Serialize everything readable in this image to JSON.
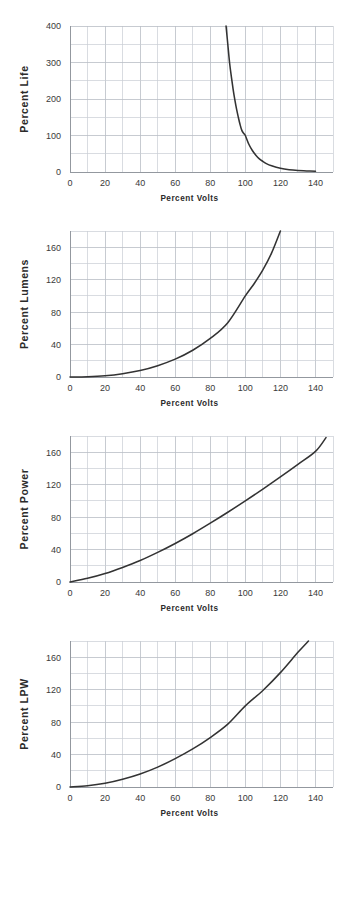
{
  "figure": {
    "background": "#ffffff",
    "curve_color": "#333333",
    "grid_color": "#c9cdd4",
    "axis_color": "#8d9299",
    "label_color": "#3a3a3a",
    "title_color": "#2b2b2b"
  },
  "chart_data": [
    {
      "type": "line",
      "title": "",
      "xlabel": "Percent Volts",
      "ylabel": "Percent Life",
      "xlim": [
        0,
        150
      ],
      "ylim": [
        0,
        400
      ],
      "xticks": [
        0,
        20,
        40,
        60,
        80,
        100,
        120,
        140
      ],
      "yticks": [
        0,
        100,
        200,
        300,
        400
      ],
      "xtick_labels": [
        "0",
        "20",
        "40",
        "60",
        "80",
        "100",
        "120",
        "140"
      ],
      "ytick_labels": [
        "0",
        "100",
        "200",
        "300",
        "400"
      ],
      "x_minor_step": 10,
      "y_minor_step": 50,
      "grid": true,
      "legend": "none",
      "series": [
        {
          "name": "Percent Life",
          "x": [
            89,
            90,
            91,
            92,
            93,
            94,
            95,
            96,
            97,
            98,
            99,
            100,
            102,
            104,
            106,
            108,
            110,
            112,
            115,
            120,
            125,
            130,
            135,
            140
          ],
          "y": [
            400,
            350,
            300,
            262,
            228,
            198,
            172,
            150,
            130,
            114,
            106,
            100,
            76,
            59,
            46,
            36,
            29,
            23,
            17,
            10,
            6,
            4,
            3,
            2
          ]
        }
      ]
    },
    {
      "type": "line",
      "title": "",
      "xlabel": "Percent Volts",
      "ylabel": "Percent Lumens",
      "xlim": [
        0,
        150
      ],
      "ylim": [
        0,
        180
      ],
      "xticks": [
        0,
        20,
        40,
        60,
        80,
        100,
        120,
        140
      ],
      "yticks": [
        0,
        40,
        80,
        120,
        160
      ],
      "xtick_labels": [
        "0",
        "20",
        "40",
        "60",
        "80",
        "100",
        "120",
        "140"
      ],
      "ytick_labels": [
        "0",
        "40",
        "80",
        "120",
        "160"
      ],
      "x_minor_step": 10,
      "y_minor_step": 20,
      "grid": true,
      "legend": "none",
      "series": [
        {
          "name": "Percent Lumens",
          "x": [
            0,
            10,
            20,
            30,
            40,
            50,
            60,
            70,
            80,
            90,
            100,
            105,
            110,
            115,
            120
          ],
          "y": [
            0,
            0.4,
            1.6,
            4.1,
            8.0,
            14.0,
            22.0,
            33.0,
            47.5,
            67.0,
            100.0,
            115.0,
            132.0,
            153.0,
            180.0
          ]
        }
      ]
    },
    {
      "type": "line",
      "title": "",
      "xlabel": "Percent Volts",
      "ylabel": "Percent Power",
      "xlim": [
        0,
        150
      ],
      "ylim": [
        0,
        180
      ],
      "xticks": [
        0,
        20,
        40,
        60,
        80,
        100,
        120,
        140
      ],
      "yticks": [
        0,
        40,
        80,
        120,
        160
      ],
      "xtick_labels": [
        "0",
        "20",
        "40",
        "60",
        "80",
        "100",
        "120",
        "140"
      ],
      "ytick_labels": [
        "0",
        "40",
        "80",
        "120",
        "160"
      ],
      "x_minor_step": 10,
      "y_minor_step": 20,
      "grid": true,
      "legend": "none",
      "series": [
        {
          "name": "Percent Power",
          "x": [
            0,
            10,
            20,
            30,
            40,
            50,
            60,
            70,
            80,
            90,
            100,
            110,
            120,
            130,
            140,
            146
          ],
          "y": [
            0,
            4.5,
            10.5,
            18.0,
            26.5,
            36.5,
            47.5,
            59.5,
            72.5,
            86.0,
            100.0,
            114.5,
            129.5,
            145.0,
            161.0,
            178.0
          ]
        }
      ]
    },
    {
      "type": "line",
      "title": "",
      "xlabel": "Percent Volts",
      "ylabel": "Percent LPW",
      "xlim": [
        0,
        150
      ],
      "ylim": [
        0,
        180
      ],
      "xticks": [
        0,
        20,
        40,
        60,
        80,
        100,
        120,
        140
      ],
      "yticks": [
        0,
        40,
        80,
        120,
        160
      ],
      "xtick_labels": [
        "0",
        "20",
        "40",
        "60",
        "80",
        "100",
        "120",
        "140"
      ],
      "ytick_labels": [
        "0",
        "40",
        "80",
        "120",
        "160"
      ],
      "x_minor_step": 10,
      "y_minor_step": 20,
      "grid": true,
      "legend": "none",
      "series": [
        {
          "name": "Percent LPW",
          "x": [
            0,
            10,
            20,
            30,
            40,
            50,
            60,
            70,
            80,
            90,
            100,
            110,
            120,
            130,
            136
          ],
          "y": [
            0,
            1.5,
            4.5,
            9.5,
            16.0,
            24.5,
            35.0,
            47.0,
            61.0,
            77.5,
            100.0,
            119.0,
            141.0,
            166.0,
            180.0
          ]
        }
      ]
    }
  ]
}
